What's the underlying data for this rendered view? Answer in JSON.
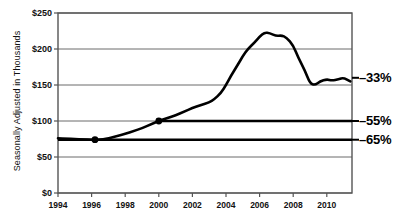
{
  "chart_data": {
    "type": "line",
    "title": "",
    "subtitle": "",
    "xlabel": "",
    "ylabel": "Seasonally Adjusted in Thousands",
    "xlim": [
      1994,
      2011.5
    ],
    "ylim": [
      0,
      250
    ],
    "grid": true,
    "legend_position": "none",
    "y_ticks": [
      0,
      50,
      100,
      150,
      200,
      250
    ],
    "y_tick_labels": [
      "$0",
      "$50",
      "$100",
      "$150",
      "$200",
      "$250"
    ],
    "x_ticks": [
      1994,
      1996,
      1998,
      2000,
      2002,
      2004,
      2006,
      2008,
      2010
    ],
    "x_tick_labels": [
      "1994",
      "1996",
      "1998",
      "2000",
      "2002",
      "2004",
      "2006",
      "2008",
      "2010"
    ],
    "series": [
      {
        "name": "Seasonally adjusted value",
        "color": "#000000",
        "x": [
          1994.0,
          1994.5,
          1995.0,
          1995.5,
          1996.0,
          1996.3,
          1996.7,
          1997.0,
          1997.5,
          1998.0,
          1998.5,
          1999.0,
          1999.5,
          2000.0,
          2000.5,
          2001.0,
          2001.5,
          2002.0,
          2002.5,
          2003.0,
          2003.3,
          2003.7,
          2004.0,
          2004.3,
          2004.7,
          2005.0,
          2005.3,
          2005.7,
          2006.0,
          2006.3,
          2006.6,
          2007.0,
          2007.3,
          2007.6,
          2008.0,
          2008.3,
          2008.7,
          2009.0,
          2009.3,
          2009.6,
          2010.0,
          2010.3,
          2010.7,
          2011.0,
          2011.4
        ],
        "y": [
          76,
          75.5,
          75,
          74.5,
          74,
          74,
          74.5,
          76,
          79,
          82,
          86,
          90,
          95,
          100,
          104,
          108,
          113,
          118,
          122,
          126,
          130,
          139,
          150,
          163,
          178,
          190,
          200,
          209,
          217,
          223,
          222,
          218,
          219,
          216,
          205,
          188,
          170,
          152,
          150,
          155,
          158,
          156,
          158,
          160,
          155
        ]
      }
    ],
    "markers": [
      {
        "label": "1996 marker",
        "x": 1996.2,
        "y": 74
      },
      {
        "label": "2000 marker",
        "x": 2000.0,
        "y": 100
      }
    ],
    "reference_lines": [
      {
        "label": "-55%",
        "y": 100,
        "from_x": 2000.0,
        "to_x": 2011.5,
        "color": "#000000"
      },
      {
        "label": "-65%",
        "y": 74,
        "from_x": 1994.0,
        "to_x": 2011.5,
        "color": "#000000"
      }
    ],
    "annotations": [
      {
        "name": "peak-decline-annotation",
        "text": "–33%",
        "value": -33,
        "y_at": 160
      },
      {
        "name": "2000-decline-annotation",
        "text": "–55%",
        "value": -55,
        "y_at": 100
      },
      {
        "name": "1996-decline-annotation",
        "text": "–65%",
        "value": -65,
        "y_at": 74
      }
    ]
  }
}
